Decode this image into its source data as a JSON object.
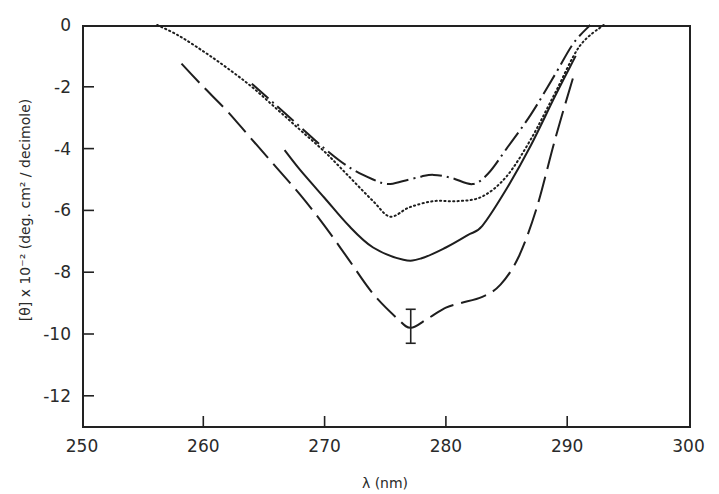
{
  "chart_data": {
    "type": "line",
    "title": "",
    "xlabel": "λ (nm)",
    "ylabel": "[θ] x 10⁻² (deg. cm² / decimole)",
    "xlim": [
      250,
      300
    ],
    "ylim": [
      -13,
      0
    ],
    "xticks": [
      250,
      260,
      270,
      280,
      290,
      300
    ],
    "yticks": [
      0,
      -2,
      -4,
      -6,
      -8,
      -10,
      -12
    ],
    "ytick_labels": [
      "0",
      "-2",
      "-4",
      "-6",
      "-8",
      "-10",
      "-12"
    ],
    "grid": false,
    "legend": null,
    "series": [
      {
        "name": "dash-dot curve",
        "style": "dashdot",
        "x": [
          264.0,
          266,
          268,
          270,
          272,
          274,
          275.2,
          276.5,
          278,
          279,
          280.5,
          282.2,
          283.5,
          285,
          287,
          289,
          290.5,
          291.9
        ],
        "y": [
          -1.9,
          -2.6,
          -3.3,
          -4.0,
          -4.6,
          -5.0,
          -5.15,
          -5.05,
          -4.9,
          -4.85,
          -4.95,
          -5.15,
          -4.8,
          -4.0,
          -2.9,
          -1.6,
          -0.6,
          0.0
        ]
      },
      {
        "name": "dotted curve",
        "style": "dotted",
        "x": [
          256.2,
          258,
          260,
          262,
          264,
          266,
          268,
          270,
          272,
          274,
          275.4,
          277,
          279,
          281,
          283,
          285,
          287,
          289,
          291,
          293
        ],
        "y": [
          0.0,
          -0.35,
          -0.85,
          -1.4,
          -2.0,
          -2.7,
          -3.4,
          -4.1,
          -4.9,
          -5.7,
          -6.2,
          -5.9,
          -5.7,
          -5.7,
          -5.55,
          -4.9,
          -3.7,
          -2.2,
          -0.7,
          0.0
        ]
      },
      {
        "name": "solid curve",
        "style": "solid",
        "x": [
          266.7,
          268,
          270,
          272,
          274,
          276.5,
          278,
          280,
          281.8,
          283,
          285,
          287,
          289,
          290.7
        ],
        "y": [
          -4.05,
          -4.7,
          -5.6,
          -6.5,
          -7.2,
          -7.6,
          -7.55,
          -7.2,
          -6.8,
          -6.5,
          -5.3,
          -3.9,
          -2.3,
          -1.0
        ]
      },
      {
        "name": "long-dash curve",
        "style": "longdash",
        "x": [
          258.2,
          260,
          262,
          264,
          266,
          268,
          270,
          272,
          274,
          276,
          277.1,
          278.5,
          280,
          281.2,
          283,
          284.5,
          286,
          287.5,
          289,
          290.6
        ],
        "y": [
          -1.25,
          -2.0,
          -2.8,
          -3.7,
          -4.6,
          -5.5,
          -6.5,
          -7.6,
          -8.7,
          -9.5,
          -9.8,
          -9.5,
          -9.15,
          -9.0,
          -8.8,
          -8.4,
          -7.5,
          -5.9,
          -3.7,
          -1.55
        ]
      }
    ],
    "annotations": [
      {
        "type": "error_bar",
        "x": 277.1,
        "y": -9.8,
        "y_low": -10.3,
        "y_high": -9.2
      }
    ]
  }
}
